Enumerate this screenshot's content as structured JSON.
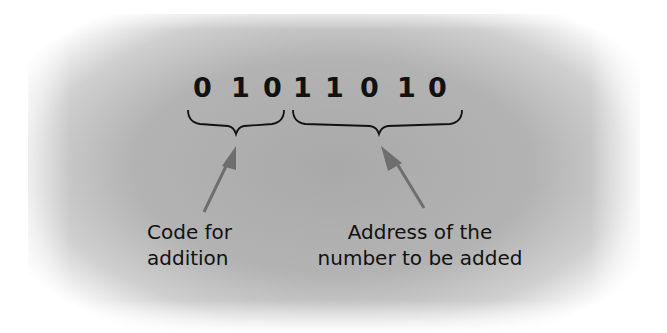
{
  "diagram": {
    "bits": [
      "0",
      "1",
      "0",
      "1",
      "1",
      "0",
      "1",
      "0"
    ],
    "groups": [
      {
        "name": "opcode",
        "bit_range": [
          0,
          2
        ],
        "label_lines": [
          "Code for",
          "addition"
        ]
      },
      {
        "name": "address",
        "bit_range": [
          3,
          7
        ],
        "label_lines": [
          "Address of the",
          "number to be added"
        ]
      }
    ],
    "colors": {
      "background": "#b0b0b0",
      "text": "#111111",
      "arrow": "#6e6e6e"
    }
  }
}
